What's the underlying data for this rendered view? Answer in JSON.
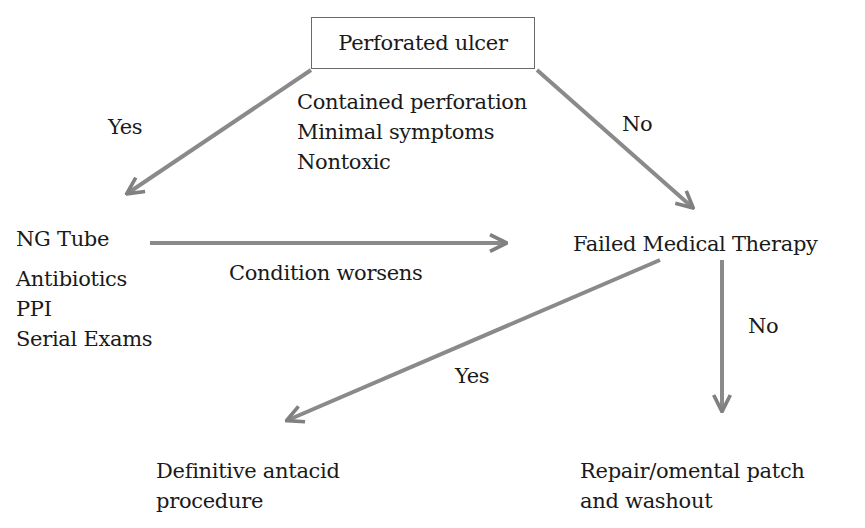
{
  "diagram": {
    "title_node": "Perforated ulcer",
    "criteria": [
      "Contained perforation",
      "Minimal symptoms",
      "Nontoxic"
    ],
    "edges": {
      "left_yes": "Yes",
      "right_no": "No",
      "condition_worsens": "Condition worsens",
      "fmt_yes": "Yes",
      "fmt_no": "No"
    },
    "medical_management": [
      "NG Tube",
      "Antibiotics",
      "PPI",
      "Serial Exams"
    ],
    "failed_node": "Failed Medical Therapy",
    "definitive": [
      "Definitive antacid",
      "procedure"
    ],
    "repair": [
      "Repair/omental patch",
      "and washout"
    ],
    "colors": {
      "arrow": "#808080",
      "text": "#1a1a1a",
      "box_border": "#6a6a6a"
    }
  }
}
